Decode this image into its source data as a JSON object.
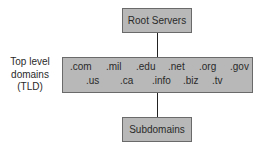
{
  "diagram": {
    "root": {
      "label": "Root Servers"
    },
    "tld": {
      "side_label": [
        "Top level",
        "domains",
        "(TLD)"
      ],
      "row1": [
        ".com",
        ".mil",
        ".edu",
        ".net",
        ".org",
        ".gov"
      ],
      "row2": [
        ".us",
        ".ca",
        ".info",
        ".biz",
        ".tv"
      ]
    },
    "subdomains": {
      "label": "Subdomains"
    },
    "edges": [
      {
        "from": "Root Servers",
        "to": "Top level domains (TLD)"
      },
      {
        "from": "Top level domains (TLD)",
        "to": "Subdomains"
      }
    ],
    "colors": {
      "box_fill": "#b8b8b8",
      "box_border": "#6a6a6a",
      "line": "#222222",
      "text": "#2a2a2a"
    }
  }
}
